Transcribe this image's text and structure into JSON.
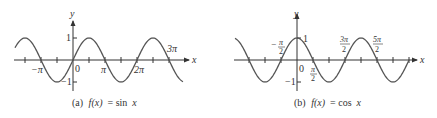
{
  "chart_data": [
    {
      "type": "line",
      "panel": "a",
      "title": "(a) f(x) = sin x",
      "caption_prefix": "(a)",
      "caption_func": "f(x)",
      "caption_eq": "= sin",
      "caption_var": "x",
      "function": "sin",
      "xlabel": "x",
      "ylabel": "y",
      "x_range": [
        -4.5,
        3.6
      ],
      "xlim_units": "multiples of pi",
      "ylim": [
        -1,
        1
      ],
      "x_tick_spacing": "pi/2",
      "x_tick_labels": [
        {
          "text": "−π",
          "value": -3.14159,
          "position": "below"
        },
        {
          "text": "0",
          "value": 0,
          "position": "below-right"
        },
        {
          "text": "π",
          "value": 3.14159,
          "position": "below"
        },
        {
          "text": "2π",
          "value": 6.28319,
          "position": "below"
        },
        {
          "text": "3π",
          "value": 9.42478,
          "position": "above"
        }
      ],
      "y_tick_labels": [
        {
          "text": "1",
          "value": 1
        },
        {
          "text": "−1",
          "value": -1
        }
      ],
      "series": [
        {
          "name": "sin x",
          "x": [
            -4.712,
            -3.142,
            -1.571,
            0,
            1.571,
            3.142,
            4.712,
            6.283,
            7.854,
            9.425,
            10.996
          ],
          "y": [
            1,
            0,
            -1,
            0,
            1,
            0,
            -1,
            0,
            1,
            0,
            -1
          ]
        }
      ],
      "grid": false,
      "legend": "none"
    },
    {
      "type": "line",
      "panel": "b",
      "title": "(b) f(x) = cos x",
      "caption_prefix": "(b)",
      "caption_func": "f(x)",
      "caption_eq": "= cos",
      "caption_var": "x",
      "function": "cos",
      "xlabel": "x",
      "ylabel": "y",
      "xlim_units": "multiples of pi",
      "ylim": [
        -1,
        1
      ],
      "x_tick_spacing": "pi/2",
      "x_tick_labels": [
        {
          "text": "−π/2",
          "value": -1.5708,
          "position": "above"
        },
        {
          "text": "0",
          "value": 0,
          "position": "below-right"
        },
        {
          "text": "π/2",
          "value": 1.5708,
          "position": "below"
        },
        {
          "text": "3π/2",
          "value": 4.7124,
          "position": "above"
        },
        {
          "text": "5π/2",
          "value": 7.854,
          "position": "above"
        }
      ],
      "y_tick_labels": [
        {
          "text": "1",
          "value": 1
        },
        {
          "text": "−1",
          "value": -1
        }
      ],
      "series": [
        {
          "name": "cos x",
          "x": [
            -6.283,
            -4.712,
            -3.142,
            -1.571,
            0,
            1.571,
            3.142,
            4.712,
            6.283,
            7.854,
            9.425,
            10.996
          ],
          "y": [
            1,
            0,
            -1,
            0,
            1,
            0,
            -1,
            0,
            1,
            0,
            -1,
            0
          ]
        }
      ],
      "grid": false,
      "legend": "none"
    }
  ],
  "labels": {
    "a": {
      "y": "y",
      "x": "x",
      "one": "1",
      "neg_one": "−1",
      "zero": "0",
      "neg_pi": "−π",
      "pi": "π",
      "two_pi": "2π",
      "three_pi": "3π",
      "caption_prefix": "(a)",
      "caption_func": "f(x)",
      "caption_eq": " = sin ",
      "caption_var": "x"
    },
    "b": {
      "y": "y",
      "x": "x",
      "one": "1",
      "neg_one": "−1",
      "zero": "0",
      "neg_pi_half_num": "π",
      "neg_sign": "−",
      "pi_half_num": "π",
      "three_pi_half_num": "3π",
      "five_pi_half_num": "5π",
      "den": "2",
      "caption_prefix": "(b)",
      "caption_func": "f(x)",
      "caption_eq": " = cos ",
      "caption_var": "x"
    }
  },
  "colors": {
    "curve": "#555555",
    "axis": "#333333",
    "text": "#333333",
    "background": "#ffffff"
  }
}
